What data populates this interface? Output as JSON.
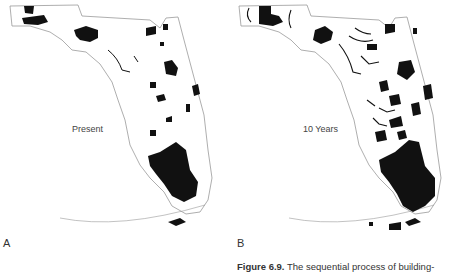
{
  "figure": {
    "caption_label": "Figure 6.9.",
    "caption_text": "The sequential process of building-",
    "panels": [
      {
        "letter": "A",
        "map_label": "Present",
        "subject": "Florida",
        "fill_color": "#111111"
      },
      {
        "letter": "B",
        "map_label": "10 Years",
        "subject": "Florida",
        "fill_color": "#111111"
      }
    ]
  }
}
